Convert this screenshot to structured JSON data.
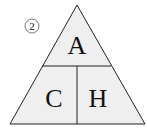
{
  "diagram": {
    "marker": "②",
    "cells": {
      "top": "A",
      "bottom_left": "C",
      "bottom_right": "H"
    },
    "colors": {
      "fill": "#efefef",
      "stroke": "#222222",
      "background": "#ffffff"
    }
  }
}
